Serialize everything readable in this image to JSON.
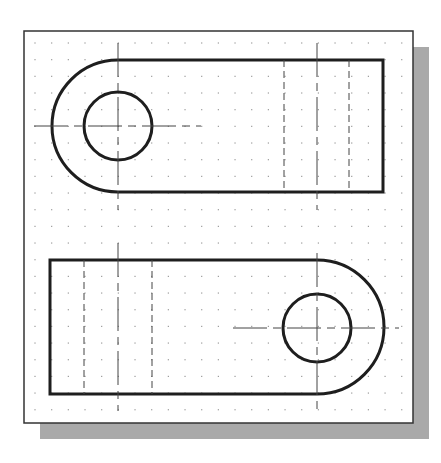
{
  "drawing": {
    "type": "orthographic-views",
    "description": "Two views of a slotted link part on a dotted grid",
    "colors": {
      "background": "#ffffff",
      "frame": "#333333",
      "shadow": "#a9a9a9",
      "grid_dot": "#9a9a9a",
      "object_line": "#1e1e1e",
      "center_line": "#444444",
      "hidden_line": "#444444"
    },
    "frame": {
      "x": 24,
      "y": 31,
      "width": 389,
      "height": 392
    },
    "shadow": {
      "offset_x": 16,
      "offset_y": 16
    },
    "grid": {
      "origin_x": 35,
      "origin_y": 43,
      "spacing": 16.67
    },
    "views": [
      {
        "name": "top-view",
        "rounded_end": "left",
        "outline": {
          "left_arc_center_x": 118,
          "center_y": 126,
          "radius": 66,
          "right_x": 383
        },
        "hole": {
          "cx": 118,
          "cy": 126,
          "r": 34
        },
        "hidden_lines_x": [
          284,
          349
        ],
        "center_line_x": 317,
        "hole_centerline_h": {
          "x1": 34,
          "x2": 201
        },
        "hole_centerline_v": {
          "y1": 43,
          "y2": 210
        },
        "slot_centerline_v": {
          "y1": 43,
          "y2": 210
        }
      },
      {
        "name": "bottom-view",
        "rounded_end": "right",
        "outline": {
          "left_x": 50,
          "top_y": 260,
          "bottom_y": 394,
          "right_arc_center_x": 317,
          "center_y": 327,
          "radius": 67
        },
        "hole": {
          "cx": 317,
          "cy": 328,
          "r": 34
        },
        "hidden_lines_x": [
          84,
          152
        ],
        "center_line_x": 118,
        "hole_centerline_h": {
          "x1": 233,
          "x2": 399
        },
        "hole_centerline_v": {
          "y1": 253,
          "y2": 411
        },
        "slot_centerline_v": {
          "y1": 243,
          "y2": 411
        }
      }
    ]
  }
}
